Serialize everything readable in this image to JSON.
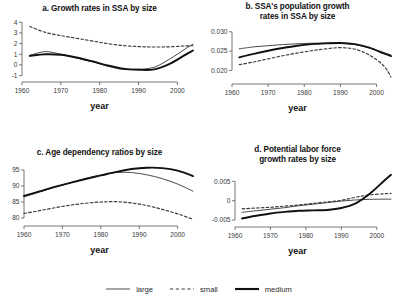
{
  "figure": {
    "xlabel": "year",
    "legend": [
      {
        "label": "large",
        "style": "solid-thin",
        "color": "#4a4a4a"
      },
      {
        "label": "small",
        "style": "dashed",
        "color": "#3a3a3a"
      },
      {
        "label": "medium",
        "style": "solid-thick",
        "color": "#111111"
      }
    ]
  },
  "chart_data": [
    {
      "type": "line",
      "panel": "a",
      "title": "a. Growth rates in SSA by size",
      "xlabel": "year",
      "ylabel": "",
      "xlim": [
        1960,
        2004
      ],
      "ylim": [
        -1.6,
        4.4
      ],
      "xticks": [
        1960,
        1970,
        1980,
        1990,
        2000
      ],
      "yticks": [
        -1,
        0,
        1,
        2,
        3,
        4
      ],
      "ytick_labels": [
        "-1",
        "0",
        "1",
        "2",
        "3",
        "4"
      ],
      "grid": false,
      "legend_position": "bottom-figure",
      "x": [
        1962,
        1966,
        1970,
        1974,
        1978,
        1982,
        1986,
        1990,
        1994,
        1998,
        2002,
        2004
      ],
      "series": [
        {
          "name": "large",
          "values": [
            0.9,
            1.25,
            1.0,
            0.65,
            0.3,
            -0.1,
            -0.42,
            -0.4,
            -0.22,
            0.55,
            1.5,
            1.95
          ]
        },
        {
          "name": "small",
          "values": [
            3.6,
            3.05,
            2.75,
            2.5,
            2.25,
            2.0,
            1.82,
            1.72,
            1.68,
            1.7,
            1.78,
            1.8
          ]
        },
        {
          "name": "medium",
          "values": [
            0.85,
            1.0,
            0.95,
            0.7,
            0.35,
            -0.05,
            -0.35,
            -0.45,
            -0.42,
            0.1,
            0.95,
            1.35
          ]
        }
      ]
    },
    {
      "type": "line",
      "panel": "b",
      "title": "b. SSA's population growth rates in SSA by size",
      "title_lines": [
        "b. SSA's population growth",
        "rates in SSA by size"
      ],
      "xlabel": "year",
      "ylabel": "",
      "xlim": [
        1960,
        2004
      ],
      "ylim": [
        0.0165,
        0.0315
      ],
      "xticks": [
        1960,
        1970,
        1980,
        1990,
        2000
      ],
      "yticks": [
        0.02,
        0.025,
        0.03
      ],
      "ytick_labels": [
        "0.020",
        "0.025",
        "0.030"
      ],
      "grid": false,
      "legend_position": "bottom-figure",
      "x": [
        1962,
        1966,
        1970,
        1974,
        1978,
        1982,
        1986,
        1990,
        1994,
        1998,
        2002,
        2004
      ],
      "series": [
        {
          "name": "large",
          "values": [
            0.0256,
            0.0261,
            0.0264,
            0.0267,
            0.0269,
            0.02705,
            0.0271,
            0.02705,
            0.0267,
            0.0258,
            0.0246,
            0.024
          ]
        },
        {
          "name": "small",
          "values": [
            0.0215,
            0.0222,
            0.023,
            0.0238,
            0.0245,
            0.0251,
            0.0256,
            0.0259,
            0.0255,
            0.024,
            0.0212,
            0.0183
          ]
        },
        {
          "name": "medium",
          "values": [
            0.0234,
            0.0243,
            0.0251,
            0.0258,
            0.0264,
            0.0268,
            0.027,
            0.0271,
            0.0268,
            0.0259,
            0.0244,
            0.0237
          ]
        }
      ]
    },
    {
      "type": "line",
      "panel": "c",
      "title": "c. Age dependency ratios by size",
      "xlabel": "year",
      "ylabel": "",
      "xlim": [
        1960,
        2004
      ],
      "ylim": [
        77.5,
        97.5
      ],
      "xticks": [
        1960,
        1970,
        1980,
        1990,
        2000
      ],
      "yticks": [
        80,
        85,
        90,
        95
      ],
      "ytick_labels": [
        "80",
        "85",
        "90",
        "95"
      ],
      "grid": false,
      "legend_position": "bottom-figure",
      "x": [
        1960,
        1964,
        1968,
        1972,
        1976,
        1980,
        1984,
        1988,
        1992,
        1996,
        2000,
        2004
      ],
      "series": [
        {
          "name": "large",
          "values": [
            86.6,
            88.1,
            89.6,
            91.0,
            92.3,
            93.4,
            94.2,
            94.2,
            93.5,
            92.3,
            90.6,
            88.4
          ]
        },
        {
          "name": "small",
          "values": [
            81.4,
            82.3,
            83.2,
            84.0,
            84.6,
            85.0,
            85.1,
            84.7,
            83.9,
            82.7,
            81.3,
            79.6
          ]
        },
        {
          "name": "medium",
          "values": [
            86.9,
            88.3,
            89.7,
            91.0,
            92.2,
            93.3,
            94.4,
            95.3,
            95.7,
            95.6,
            94.8,
            93.1
          ]
        }
      ]
    },
    {
      "type": "line",
      "panel": "d",
      "title": "d. Potential labor force growth rates by size",
      "title_lines": [
        "d. Potential labor force",
        "growth rates by size"
      ],
      "xlabel": "year",
      "ylabel": "",
      "xlim": [
        1960,
        2004
      ],
      "ylim": [
        -0.0068,
        0.0082
      ],
      "xticks": [
        1960,
        1970,
        1980,
        1990,
        2000
      ],
      "yticks": [
        -0.005,
        0,
        0.005
      ],
      "ytick_labels": [
        "-0.005",
        "0",
        "0.005"
      ],
      "grid": false,
      "legend_position": "bottom-figure",
      "x": [
        1962,
        1966,
        1970,
        1974,
        1978,
        1982,
        1986,
        1990,
        1994,
        1998,
        2002,
        2004
      ],
      "series": [
        {
          "name": "large",
          "values": [
            -0.003,
            -0.0026,
            -0.0022,
            -0.0018,
            -0.0013,
            -0.0009,
            -0.0005,
            -0.0001,
            0.0002,
            0.00035,
            0.0004,
            0.0004
          ]
        },
        {
          "name": "small",
          "values": [
            -0.0021,
            -0.0019,
            -0.0017,
            -0.0014,
            -0.0011,
            -0.0007,
            -0.0003,
            0.0001,
            0.0009,
            0.0015,
            0.0018,
            0.0019
          ]
        },
        {
          "name": "medium",
          "values": [
            -0.0046,
            -0.0039,
            -0.0033,
            -0.0029,
            -0.0026,
            -0.0025,
            -0.0024,
            -0.0019,
            -0.0007,
            0.0018,
            0.0051,
            0.0067
          ]
        }
      ]
    }
  ]
}
